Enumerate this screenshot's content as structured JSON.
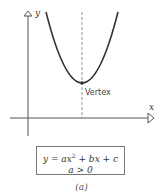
{
  "diagram": {
    "type": "parabola-upward",
    "axes": {
      "x_label": "x",
      "y_label": "y"
    },
    "vertex_label": "Vertex",
    "equation": {
      "line1_prefix": "y = ax",
      "line1_exp": "2",
      "line1_suffix": " + bx + c",
      "line2": "a > 0"
    },
    "caption": "(a)",
    "colors": {
      "curve": "#333333",
      "axis": "#555555",
      "dashed": "#777777",
      "box_border": "#777777"
    }
  }
}
